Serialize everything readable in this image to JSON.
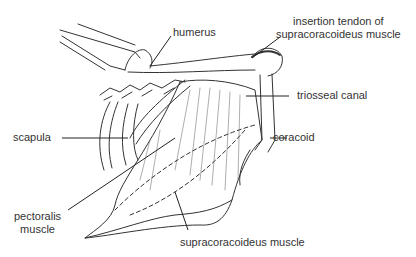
{
  "diagram": {
    "labels": {
      "humerus": "humerus",
      "insertion_tendon_line1": "insertion tendon of",
      "insertion_tendon_line2": "supracoracoideus muscle",
      "triosseal_canal": "triosseal canal",
      "scapula": "scapula",
      "coracoid": "coracoid",
      "pectoralis_line1": "pectoralis",
      "pectoralis_line2": "muscle",
      "supracoracoideus": "supracoracoideus muscle"
    },
    "colors": {
      "line": "#333333",
      "text": "#333333",
      "background": "#ffffff"
    }
  }
}
